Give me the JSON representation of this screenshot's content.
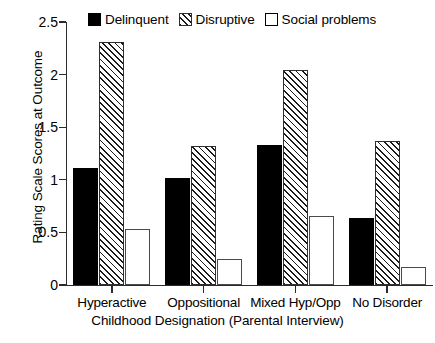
{
  "chart_data": {
    "type": "bar",
    "title": "",
    "xlabel": "Childhood Designation (Parental Interview)",
    "ylabel": "Rating Scale Scores at Outcome",
    "categories": [
      "Hyperactive",
      "Oppositional",
      "Mixed Hyp/Opp",
      "No Disorder"
    ],
    "series": [
      {
        "name": "Delinquent",
        "style": "solid-black",
        "values": [
          1.11,
          1.02,
          1.33,
          0.64
        ]
      },
      {
        "name": "Disruptive",
        "style": "diagonal-hatch",
        "values": [
          2.31,
          1.32,
          2.04,
          1.37
        ]
      },
      {
        "name": "Social problems",
        "style": "open-white",
        "values": [
          0.53,
          0.25,
          0.66,
          0.17
        ]
      }
    ],
    "ylim": [
      0,
      2.5
    ],
    "yticks": [
      "0",
      "0.5",
      "1",
      "1.5",
      "2",
      "2.5"
    ],
    "ytick_values": [
      0,
      0.5,
      1,
      1.5,
      2,
      2.5
    ],
    "grid": false,
    "legend_position": "top-center"
  },
  "legend": {
    "entries": [
      {
        "label": "Delinquent"
      },
      {
        "label": "Disruptive"
      },
      {
        "label": "Social problems"
      }
    ]
  },
  "colors": {
    "delinquent": "#000000",
    "disruptive_fill": "#ffffff",
    "disruptive_hatch": "#1a1a1a",
    "social_problems": "#ffffff",
    "axis": "#2b2b2b",
    "background": "#ffffff"
  },
  "top_partial_text": ""
}
